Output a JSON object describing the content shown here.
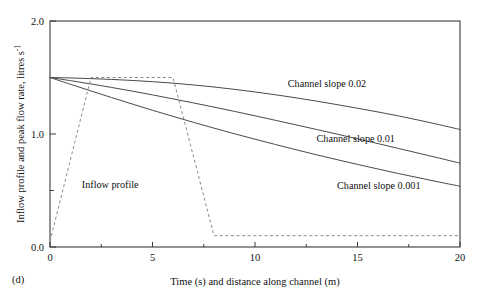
{
  "figure": {
    "panel_label": "(d)",
    "background_color": "#ffffff",
    "line_color": "#4a4a4a",
    "dashed_color": "#8a8a8a",
    "axis_color": "#3a3a3a"
  },
  "chart_data": {
    "type": "line",
    "title": "",
    "xlabel": "Time (s) and distance along channel (m)",
    "ylabel": "Inflow profile and peak flow rate, litres s",
    "ylabel_exponent": "-1",
    "xlim": [
      0,
      20
    ],
    "ylim": [
      0,
      2.0
    ],
    "grid": false,
    "legend_position": "inline-annotations",
    "xticks": [
      0,
      5,
      10,
      15,
      20
    ],
    "xtick_labels": [
      "0",
      "5",
      "10",
      "15",
      "20"
    ],
    "yticks": [
      0.0,
      0.5,
      1.0,
      1.5,
      2.0
    ],
    "ytick_labels": [
      "0.0",
      "",
      "1.0",
      "",
      "2.0"
    ],
    "y_minor_ticks": [
      0.5,
      1.5
    ],
    "series": [
      {
        "name": "Channel slope 0.02",
        "style": "solid",
        "label_text": "Channel slope 0.02",
        "label_x": 11.6,
        "label_y": 1.42,
        "x": [
          0,
          1,
          2,
          3,
          4,
          5,
          6,
          7,
          8,
          9,
          10,
          11,
          12,
          13,
          14,
          15,
          16,
          17,
          18,
          19,
          20
        ],
        "y": [
          1.5,
          1.496,
          1.49,
          1.483,
          1.474,
          1.463,
          1.45,
          1.434,
          1.416,
          1.395,
          1.372,
          1.347,
          1.32,
          1.291,
          1.26,
          1.228,
          1.195,
          1.16,
          1.122,
          1.082,
          1.04
        ]
      },
      {
        "name": "Channel slope 0.01",
        "style": "solid",
        "label_text": "Channel slope 0.01",
        "label_x": 13.0,
        "label_y": 0.93,
        "x": [
          0,
          1,
          2,
          3,
          4,
          5,
          6,
          7,
          8,
          9,
          10,
          11,
          12,
          13,
          14,
          15,
          16,
          17,
          18,
          19,
          20
        ],
        "y": [
          1.5,
          1.472,
          1.443,
          1.412,
          1.38,
          1.346,
          1.311,
          1.275,
          1.238,
          1.2,
          1.161,
          1.121,
          1.081,
          1.04,
          0.999,
          0.957,
          0.915,
          0.872,
          0.829,
          0.786,
          0.742
        ]
      },
      {
        "name": "Channel slope 0.001",
        "style": "solid",
        "label_text": "Channel slope 0.001",
        "label_x": 14.0,
        "label_y": 0.51,
        "x": [
          0,
          1,
          2,
          3,
          4,
          5,
          6,
          7,
          8,
          9,
          10,
          11,
          12,
          13,
          14,
          15,
          16,
          17,
          18,
          19,
          20
        ],
        "y": [
          1.5,
          1.44,
          1.381,
          1.323,
          1.266,
          1.21,
          1.156,
          1.103,
          1.052,
          1.002,
          0.954,
          0.907,
          0.861,
          0.816,
          0.773,
          0.731,
          0.69,
          0.65,
          0.612,
          0.574,
          0.538
        ]
      },
      {
        "name": "Inflow profile",
        "style": "dashed",
        "label_text": "Inflow profile",
        "label_x": 1.55,
        "label_y": 0.52,
        "x": [
          0,
          2.0,
          6.0,
          8.0,
          20
        ],
        "y": [
          0.05,
          1.5,
          1.5,
          0.1,
          0.1
        ]
      }
    ]
  }
}
